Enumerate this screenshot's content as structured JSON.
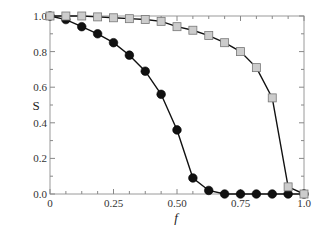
{
  "chart_data": {
    "type": "line",
    "title": "",
    "xlabel": "f",
    "ylabel": "S",
    "xlim": [
      0,
      1.0
    ],
    "ylim": [
      0,
      1.0
    ],
    "grid": false,
    "legend": null,
    "x_ticks": [
      0,
      0.25,
      0.5,
      0.75,
      1.0
    ],
    "x_tick_labels": [
      "0",
      "0.25",
      "0.50",
      "0.75",
      "1.0"
    ],
    "y_ticks": [
      0,
      0.2,
      0.4,
      0.6,
      0.8,
      1.0
    ],
    "y_tick_labels": [
      "0.0",
      "0.2",
      "0.4",
      "0.6",
      "0.8",
      "1.0"
    ],
    "x": [
      0,
      0.0625,
      0.125,
      0.1875,
      0.25,
      0.3125,
      0.375,
      0.4375,
      0.5,
      0.5625,
      0.625,
      0.6875,
      0.75,
      0.8125,
      0.875,
      0.9375,
      1.0
    ],
    "series": [
      {
        "name": "filled circles",
        "marker": "circle",
        "color": "#111111",
        "values": [
          1.0,
          0.98,
          0.94,
          0.9,
          0.85,
          0.78,
          0.69,
          0.56,
          0.36,
          0.09,
          0.02,
          0.0,
          0.0,
          0.0,
          0.0,
          0.0,
          0.0
        ]
      },
      {
        "name": "open squares",
        "marker": "square",
        "color": "#cccccc",
        "values": [
          1.0,
          1.0,
          1.0,
          0.995,
          0.99,
          0.985,
          0.98,
          0.97,
          0.94,
          0.92,
          0.89,
          0.85,
          0.8,
          0.71,
          0.54,
          0.04,
          0.0
        ]
      }
    ]
  }
}
